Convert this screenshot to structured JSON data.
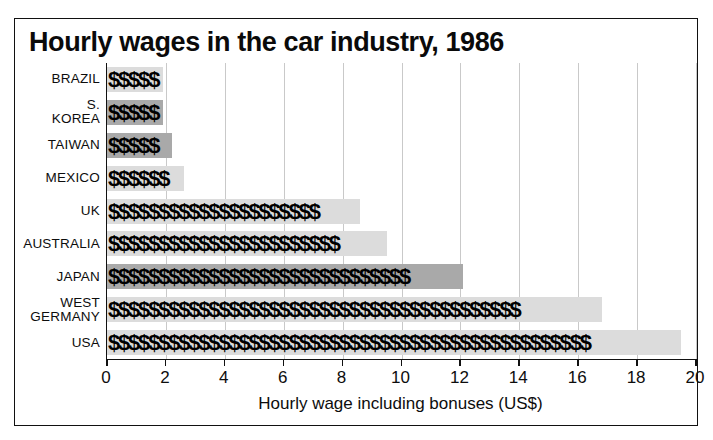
{
  "chart_data": {
    "type": "bar",
    "title": "Hourly wages in the car industry, 1986",
    "orientation": "horizontal",
    "xlabel": "Hourly wage including bonuses (US$)",
    "ylabel": "",
    "xlim": [
      0,
      20
    ],
    "xticks": [
      0,
      2,
      4,
      6,
      8,
      10,
      12,
      14,
      16,
      18,
      20
    ],
    "xtick_labels": [
      "0",
      "2",
      "4",
      "6",
      "8",
      "10",
      "12",
      "14",
      "16",
      "18",
      "20"
    ],
    "grid": true,
    "legend": "none",
    "categories": [
      "BRAZIL",
      "S. KOREA",
      "TAIWAN",
      "MEXICO",
      "UK",
      "AUSTRALIA",
      "JAPAN",
      "WEST\nGERMANY",
      "USA"
    ],
    "values": [
      1.9,
      1.9,
      2.2,
      2.6,
      8.6,
      9.5,
      12.1,
      16.8,
      19.5
    ],
    "bar_fill_glyph": "$",
    "bar_shades": [
      "light",
      "dark",
      "dark",
      "light",
      "light",
      "light",
      "dark",
      "light",
      "light"
    ],
    "colors": {
      "shade_light": "#dcdcdc",
      "shade_dark": "#a9a9a9",
      "glyph": "#000000",
      "axis": "#111111",
      "gridline": "#c9c9c9",
      "background": "#ffffff"
    }
  }
}
